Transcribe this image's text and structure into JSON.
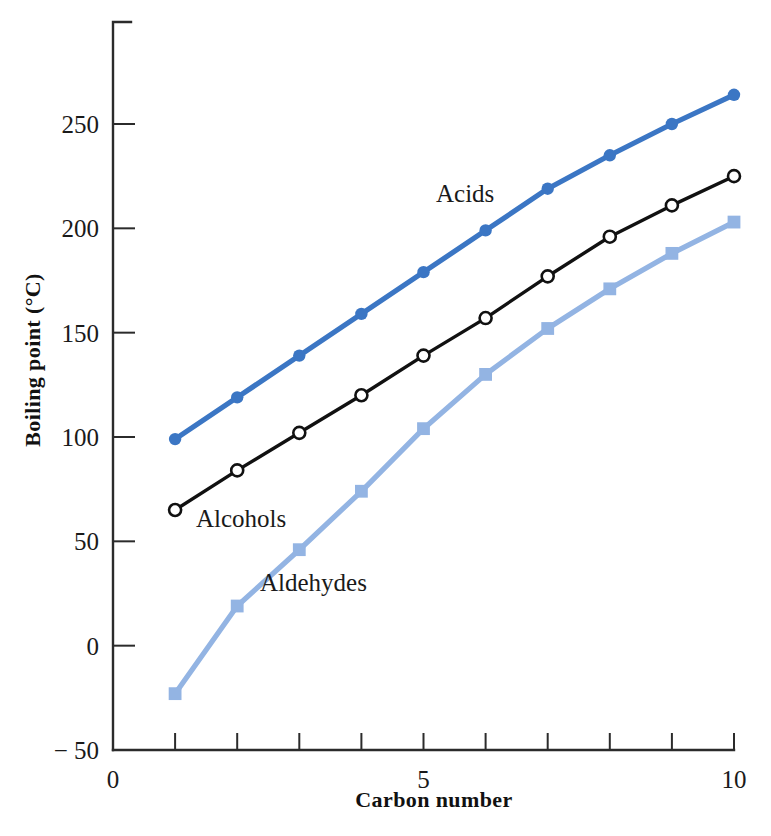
{
  "chart_data": {
    "type": "line",
    "title": "",
    "xlabel": "Carbon number",
    "ylabel": "Boiling point (°C)",
    "xlim": [
      0,
      10
    ],
    "ylim": [
      -50,
      290
    ],
    "x": [
      1,
      2,
      3,
      4,
      5,
      6,
      7,
      8,
      9,
      10
    ],
    "xticks": [
      0,
      1,
      2,
      3,
      4,
      5,
      6,
      7,
      8,
      9,
      10
    ],
    "xtick_labels_shown": [
      "0",
      "5",
      "10"
    ],
    "yticks": [
      -50,
      0,
      50,
      100,
      150,
      200,
      250
    ],
    "ytick_labels": [
      "− 50",
      "0",
      "50",
      "100",
      "150",
      "200",
      "250"
    ],
    "grid": false,
    "legend_position": "inline-annotations",
    "series": [
      {
        "name": "Acids",
        "color": "#3B76C4",
        "marker": "filled-circle",
        "values": [
          99,
          119,
          139,
          159,
          179,
          199,
          219,
          235,
          250,
          264
        ]
      },
      {
        "name": "Alcohols",
        "color": "#111111",
        "marker": "open-circle",
        "values": [
          65,
          84,
          102,
          120,
          139,
          157,
          177,
          196,
          211,
          225
        ]
      },
      {
        "name": "Aldehydes",
        "color": "#93B4E3",
        "marker": "filled-square",
        "values": [
          -23,
          19,
          46,
          74,
          104,
          130,
          152,
          171,
          188,
          203
        ]
      }
    ],
    "annotations": [
      {
        "text": "Acids",
        "x_px": 436,
        "y_px": 202
      },
      {
        "text": "Alcohols",
        "x_px": 196,
        "y_px": 527
      },
      {
        "text": "Aldehydes",
        "x_px": 260,
        "y_px": 591
      }
    ]
  },
  "axis": {
    "x_tick_label_0": "0",
    "x_tick_label_5": "5",
    "x_tick_label_10": "10",
    "y_tick_label_250": "250",
    "y_tick_label_200": "200",
    "y_tick_label_150": "150",
    "y_tick_label_100": "100",
    "y_tick_label_50": "50",
    "y_tick_label_0": "0",
    "y_tick_label_m50": "− 50",
    "x_title": "Carbon number",
    "y_title": "Boiling point (°C)"
  }
}
